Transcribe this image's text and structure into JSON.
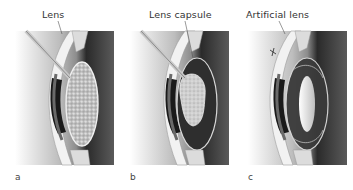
{
  "figure": {
    "panels": [
      {
        "letter": "a",
        "callout": "Lens"
      },
      {
        "letter": "b",
        "callout": "Lens capsule"
      },
      {
        "letter": "c",
        "callout": "Artificial lens"
      }
    ]
  }
}
